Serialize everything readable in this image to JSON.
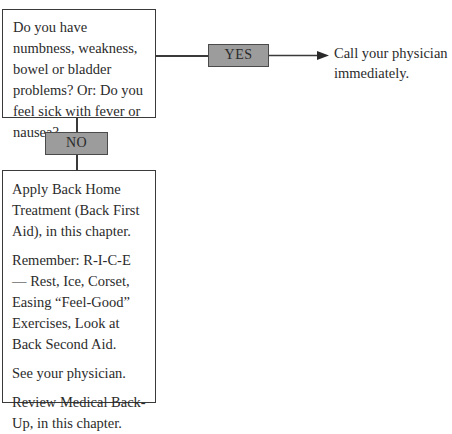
{
  "flowchart": {
    "question": {
      "text": "Do you have numbness, weakness, bowel or bladder problems? Or: Do you feel sick with fever or nausea?"
    },
    "yes_branch": {
      "label": "YES",
      "result": "Call your physician immediately."
    },
    "no_branch": {
      "label": "NO",
      "actions": [
        "Apply Back Home Treatment (Back First Aid), in this chapter.",
        "Remember: R-I-C-E — Rest, Ice, Corset, Easing “Feel-Good” Exercises, Look at Back Second Aid.",
        "See your physician.",
        "Review Medical Back-Up, in this chapter."
      ]
    },
    "colors": {
      "label_fill": "#9c9c9c",
      "border": "#3a3a3a",
      "text": "#2b2b2b"
    }
  }
}
